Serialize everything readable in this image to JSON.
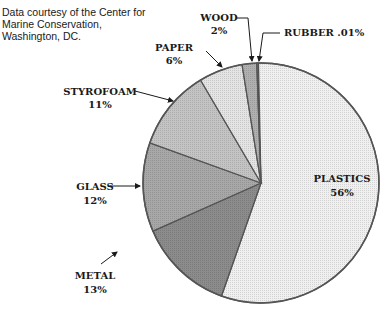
{
  "credit": {
    "lines": [
      "Data courtesy of the Center for",
      "Marine Conservation,",
      "Washington, DC."
    ]
  },
  "chart_data": {
    "type": "pie",
    "title": "",
    "source": "Data courtesy of the Center for Marine Conservation, Washington, DC.",
    "categories": [
      "PLASTICS",
      "METAL",
      "GLASS",
      "STYROFOAM",
      "PAPER",
      "WOOD",
      "RUBBER"
    ],
    "values": [
      56,
      13,
      12,
      11,
      6,
      2,
      0.01
    ],
    "value_labels": [
      "56%",
      "13%",
      "12%",
      "11%",
      "6%",
      "2%",
      ".01%"
    ],
    "colors": [
      "#f0f0f0",
      "#8c8c8c",
      "#a8a8a8",
      "#c4c4c4",
      "#e4e4e4",
      "#b0b0b0",
      "#7a7a7a"
    ],
    "start_angle_deg": -2,
    "direction": "clockwise",
    "legend": "none (callout labels)"
  },
  "labels": {
    "plastics": {
      "name": "PLASTICS",
      "pct": "56%"
    },
    "metal": {
      "name": "METAL",
      "pct": "13%"
    },
    "glass": {
      "name": "GLASS",
      "pct": "12%"
    },
    "styrofoam": {
      "name": "STYROFOAM",
      "pct": "11%"
    },
    "paper": {
      "name": "PAPER",
      "pct": "6%"
    },
    "wood": {
      "name": "WOOD",
      "pct": "2%"
    },
    "rubber": {
      "name": "RUBBER .01%"
    }
  }
}
